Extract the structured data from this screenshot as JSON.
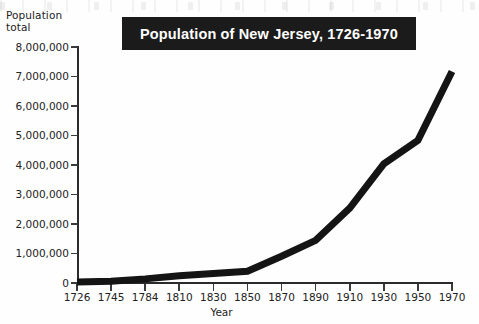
{
  "chart_data": {
    "type": "line",
    "title": "Population of New Jersey, 1726-1970",
    "xlabel": "Year",
    "ylabel": "Population total",
    "ylabel_lines": [
      "Population",
      "total"
    ],
    "categories": [
      "1726",
      "1745",
      "1784",
      "1810",
      "1830",
      "1850",
      "1870",
      "1890",
      "1910",
      "1930",
      "1950",
      "1970"
    ],
    "values": [
      32500,
      61000,
      139600,
      245600,
      320800,
      400000,
      906000,
      1445000,
      2537000,
      4041000,
      4835000,
      7168000
    ],
    "ylim": [
      0,
      8000000
    ],
    "ytick_values": [
      0,
      1000000,
      2000000,
      3000000,
      4000000,
      5000000,
      6000000,
      7000000,
      8000000
    ],
    "ytick_labels": [
      "0",
      "1,000,000",
      "2,000,000",
      "3,000,000",
      "4,000,000",
      "5,000,000",
      "6,000,000",
      "7,000,000",
      "8,000,000"
    ],
    "grid": false,
    "legend": "none",
    "series": [
      {
        "name": "Population of New Jersey",
        "color": "#141414",
        "values": [
          32500,
          61000,
          139600,
          245600,
          320800,
          400000,
          906000,
          1445000,
          2537000,
          4041000,
          4835000,
          7168000
        ]
      }
    ]
  },
  "colors": {
    "line": "#141414",
    "axis": "#2b2b2b",
    "title_background": "#1b1b1b",
    "title_text": "#ffffff",
    "page_background": "#fefefe",
    "text": "#222222"
  }
}
